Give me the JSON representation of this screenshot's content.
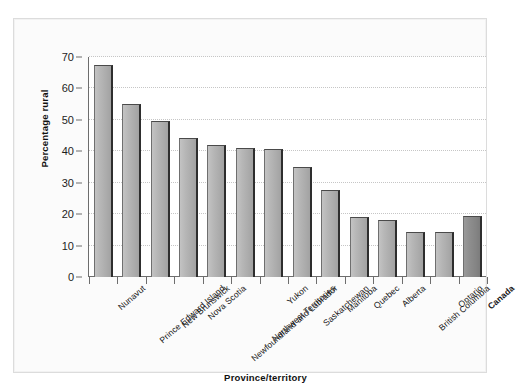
{
  "chart_data": {
    "type": "bar",
    "title": "",
    "xlabel": "Province/territory",
    "ylabel": "Percentage rural",
    "ylim": [
      0,
      70
    ],
    "ytick_values": [
      0,
      10,
      20,
      30,
      40,
      50,
      60,
      70
    ],
    "ytick_labels": [
      "0",
      "10",
      "20",
      "30",
      "40",
      "50",
      "60",
      "70"
    ],
    "grid": true,
    "legend": "none",
    "categories": [
      "Nunavut",
      "Prince Edward Island",
      "New Brunswick",
      "Nova Scotia",
      "Newfoundland and Labrador",
      "Northwest Territories",
      "Yukon",
      "Saskatchewan",
      "Manitoba",
      "Quebec",
      "Alberta",
      "British Columbia",
      "Ontario",
      "Canada"
    ],
    "values": [
      67.4,
      55.2,
      49.7,
      44.1,
      42.0,
      41.0,
      40.8,
      35.0,
      27.7,
      19.0,
      18.3,
      14.2,
      14.2,
      19.3
    ],
    "highlight_category": "Canada",
    "colors": {
      "bar_fill": "#b6b6b6",
      "bar_highlight_fill": "#8e8e8e",
      "bar_edge": "#2e2e2e",
      "axis": "#6d6d6d",
      "gridline": "#c6c6c6",
      "text": "#141414",
      "plot_background": "#ffffff",
      "page_background": "#fbfbfb"
    }
  }
}
